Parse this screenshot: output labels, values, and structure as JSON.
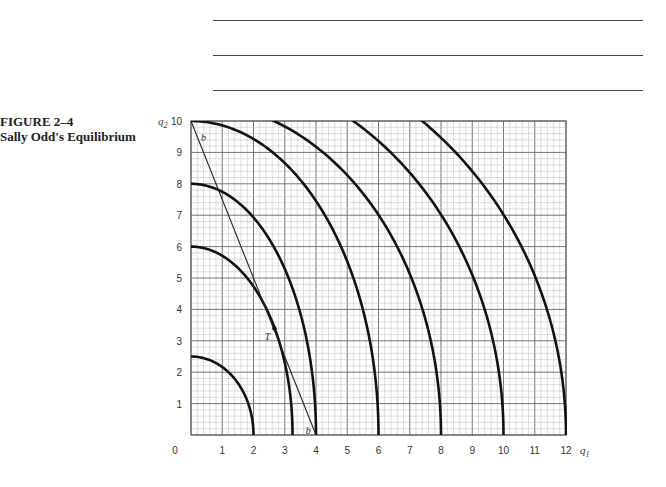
{
  "caption": {
    "figure_number": "FIGURE 2–4",
    "title": "Sally Odd's Equilibrium"
  },
  "answer_rules": 3,
  "chart_data": {
    "type": "line",
    "title": "Sally Odd's Equilibrium",
    "figure": "FIGURE 2–4",
    "xlabel": "q1",
    "ylabel": "q2",
    "xlim": [
      0,
      12
    ],
    "ylim": [
      0,
      10
    ],
    "xticks": [
      0,
      1,
      2,
      3,
      4,
      5,
      6,
      7,
      8,
      9,
      10,
      11,
      12
    ],
    "yticks": [
      1,
      2,
      3,
      4,
      5,
      6,
      7,
      8,
      9,
      10
    ],
    "grid": true,
    "minor_grid_per_unit": 5,
    "series": [
      {
        "name": "production possibility curve 1",
        "kind": "ellipse",
        "q1_intercept": 2,
        "q2_intercept": 2.5
      },
      {
        "name": "production possibility curve 2",
        "kind": "ellipse",
        "q1_intercept": 3.25,
        "q2_intercept": 6
      },
      {
        "name": "production possibility curve 3",
        "kind": "ellipse",
        "q1_intercept": 4,
        "q2_intercept": 8
      },
      {
        "name": "production possibility curve 4",
        "kind": "ellipse",
        "q1_intercept": 6,
        "q2_intercept": 10
      },
      {
        "name": "production possibility curve 5",
        "kind": "ellipse",
        "q1_intercept": 8,
        "q2_intercept": 10.6
      },
      {
        "name": "production possibility curve 6",
        "kind": "ellipse",
        "q1_intercept": 10,
        "q2_intercept": 11.7
      },
      {
        "name": "production possibility curve 7",
        "kind": "ellipse",
        "q1_intercept": 12,
        "q2_intercept": 12.7
      }
    ],
    "budget_line": {
      "label": "b",
      "from": [
        0,
        10
      ],
      "to": [
        4,
        0
      ]
    },
    "annotations": [
      {
        "text": "b",
        "q1": 0.4,
        "q2": 9.5
      },
      {
        "text": "b",
        "q1": 3.75,
        "q2": 0.15
      },
      {
        "text": "T",
        "q1": 2.45,
        "q2": 3.15,
        "point": [
          2.67,
          3.4
        ]
      }
    ]
  }
}
